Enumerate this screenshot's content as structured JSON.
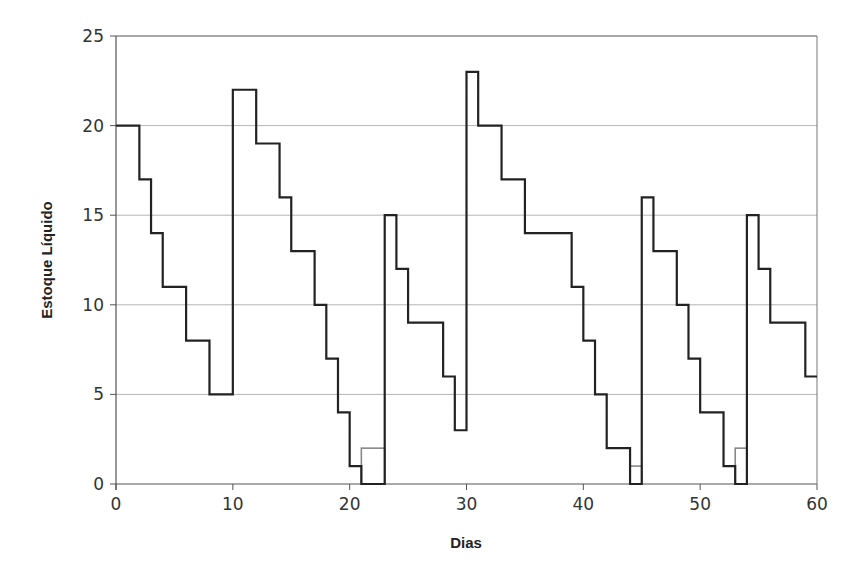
{
  "chart_data": {
    "type": "line",
    "subtype": "step",
    "title": "",
    "xlabel": "Dias",
    "ylabel": "Estoque Líquido",
    "xlim": [
      0,
      60
    ],
    "ylim": [
      0,
      25
    ],
    "x_ticks": [
      0,
      10,
      20,
      30,
      40,
      50,
      60
    ],
    "y_ticks": [
      0,
      5,
      10,
      15,
      20,
      25
    ],
    "grid": "horizontal",
    "legend": "none",
    "series": [
      {
        "name": "Estoque Líquido",
        "color": "#222222",
        "steps": [
          {
            "x0": 0,
            "x1": 2,
            "y": 20
          },
          {
            "x0": 2,
            "x1": 3,
            "y": 17
          },
          {
            "x0": 3,
            "x1": 4,
            "y": 14
          },
          {
            "x0": 4,
            "x1": 6,
            "y": 11
          },
          {
            "x0": 6,
            "x1": 8,
            "y": 8
          },
          {
            "x0": 8,
            "x1": 10,
            "y": 5
          },
          {
            "x0": 10,
            "x1": 12,
            "y": 22
          },
          {
            "x0": 12,
            "x1": 14,
            "y": 19
          },
          {
            "x0": 14,
            "x1": 15,
            "y": 16
          },
          {
            "x0": 15,
            "x1": 17,
            "y": 13
          },
          {
            "x0": 17,
            "x1": 18,
            "y": 10
          },
          {
            "x0": 18,
            "x1": 19,
            "y": 7
          },
          {
            "x0": 19,
            "x1": 20,
            "y": 4
          },
          {
            "x0": 20,
            "x1": 21,
            "y": 1
          },
          {
            "x0": 21,
            "x1": 23,
            "y": 0
          },
          {
            "x0": 23,
            "x1": 24,
            "y": 15
          },
          {
            "x0": 24,
            "x1": 25,
            "y": 12
          },
          {
            "x0": 25,
            "x1": 28,
            "y": 9
          },
          {
            "x0": 28,
            "x1": 29,
            "y": 6
          },
          {
            "x0": 29,
            "x1": 30,
            "y": 3
          },
          {
            "x0": 30,
            "x1": 31,
            "y": 23
          },
          {
            "x0": 31,
            "x1": 33,
            "y": 20
          },
          {
            "x0": 33,
            "x1": 35,
            "y": 17
          },
          {
            "x0": 35,
            "x1": 39,
            "y": 14
          },
          {
            "x0": 39,
            "x1": 40,
            "y": 11
          },
          {
            "x0": 40,
            "x1": 41,
            "y": 8
          },
          {
            "x0": 41,
            "x1": 42,
            "y": 5
          },
          {
            "x0": 42,
            "x1": 44,
            "y": 2
          },
          {
            "x0": 44,
            "x1": 45,
            "y": 0
          },
          {
            "x0": 45,
            "x1": 46,
            "y": 16
          },
          {
            "x0": 46,
            "x1": 48,
            "y": 13
          },
          {
            "x0": 48,
            "x1": 49,
            "y": 10
          },
          {
            "x0": 49,
            "x1": 50,
            "y": 7
          },
          {
            "x0": 50,
            "x1": 52,
            "y": 4
          },
          {
            "x0": 52,
            "x1": 53,
            "y": 1
          },
          {
            "x0": 53,
            "x1": 54,
            "y": 0
          },
          {
            "x0": 54,
            "x1": 55,
            "y": 15
          },
          {
            "x0": 55,
            "x1": 56,
            "y": 12
          },
          {
            "x0": 56,
            "x1": 59,
            "y": 9
          },
          {
            "x0": 59,
            "x1": 60,
            "y": 6
          }
        ]
      },
      {
        "name": "Pedidos Pendentes",
        "color": "#888888",
        "boxes": [
          {
            "x0": 21,
            "x1": 23,
            "y": 2
          },
          {
            "x0": 44,
            "x1": 45,
            "y": 1
          },
          {
            "x0": 53,
            "x1": 54,
            "y": 2
          }
        ]
      }
    ]
  }
}
